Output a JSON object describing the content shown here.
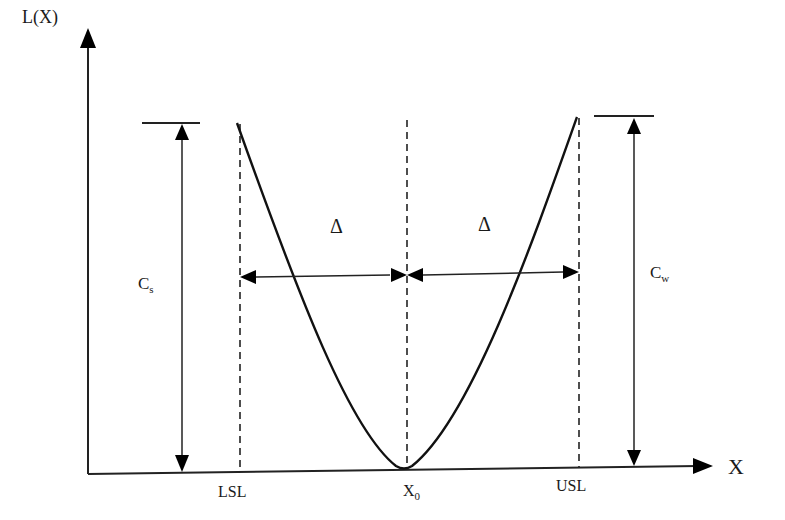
{
  "diagram": {
    "y_axis_label": "L(X)",
    "x_axis_label": "X",
    "x_ticks": {
      "lsl": "LSL",
      "x0_main": "X",
      "x0_sub": "0",
      "usl": "USL"
    },
    "left_cost": {
      "main": "C",
      "sub": "s"
    },
    "right_cost": {
      "main": "C",
      "sub": "w"
    },
    "delta_left": "Δ",
    "delta_right": "Δ"
  },
  "colors": {
    "line": "#222222",
    "background": "#ffffff"
  }
}
